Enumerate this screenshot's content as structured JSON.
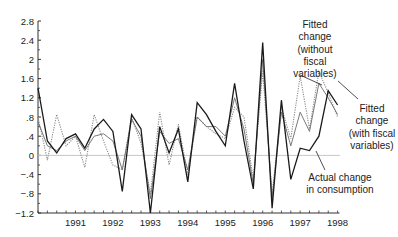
{
  "chart_data": {
    "type": "line",
    "title": "",
    "xlabel": "",
    "ylabel": "",
    "ylim": [
      -1.2,
      2.8
    ],
    "yticks": [
      2.8,
      2.4,
      2,
      1.6,
      1.2,
      0.8,
      0.4,
      0,
      -0.4,
      -0.8,
      -1.2
    ],
    "ytick_labels": [
      "2.8",
      "2.4",
      "2",
      "1.6",
      "1.2",
      ".8",
      ".4",
      "0",
      "-.4",
      "-.8",
      "-1.2"
    ],
    "xtick_labels": [
      "1991",
      "1992",
      "1993",
      "1994",
      "1995",
      "1996",
      "1997",
      "1998"
    ],
    "x_start": 1990.0,
    "x_step": 0.25,
    "grid": false,
    "zero_line": true,
    "series": [
      {
        "name": "Actual change in consumption",
        "style": "solid-dark",
        "values": [
          1.4,
          0.3,
          0.05,
          0.35,
          0.45,
          0.15,
          0.55,
          0.75,
          0.5,
          -0.75,
          0.85,
          0.55,
          -1.2,
          0.6,
          0.05,
          0.55,
          -0.55,
          1.1,
          0.85,
          0.5,
          0.2,
          1.5,
          0.3,
          -0.7,
          2.35,
          -1.1,
          1.15,
          -0.5,
          0.15,
          0.1,
          0.4,
          1.35,
          1.05
        ]
      },
      {
        "name": "Fitted change (with fiscal variables)",
        "style": "solid-gray",
        "values": [
          0.7,
          0.2,
          0.1,
          0.3,
          0.4,
          0.1,
          0.4,
          0.45,
          0.3,
          -0.3,
          0.75,
          0.4,
          -0.9,
          0.5,
          0.25,
          0.35,
          -0.3,
          0.8,
          0.6,
          0.6,
          0.4,
          1.2,
          0.55,
          -0.6,
          2.0,
          -0.9,
          0.9,
          0.2,
          0.9,
          0.5,
          1.5,
          1.2,
          0.85
        ]
      },
      {
        "name": "Fitted change (without fiscal variables)",
        "style": "dotted",
        "values": [
          0.8,
          -0.1,
          0.85,
          0.2,
          0.4,
          -0.25,
          0.85,
          0.3,
          -0.2,
          -0.3,
          0.8,
          0.25,
          -0.8,
          0.9,
          -0.2,
          0.65,
          -0.4,
          0.8,
          0.6,
          0.45,
          0.35,
          1.0,
          0.8,
          -0.5,
          1.75,
          -0.8,
          1.0,
          0.35,
          1.65,
          0.55,
          1.75,
          1.3,
          0.8
        ]
      }
    ],
    "annotations": [
      {
        "text": [
          "Fitted",
          "change",
          "(without",
          "fiscal",
          "variables)"
        ],
        "target": "Fitted change (without fiscal variables)"
      },
      {
        "text": [
          "Fitted",
          "change",
          "(with fiscal",
          "variables)"
        ],
        "target": "Fitted change (with fiscal variables)"
      },
      {
        "text": [
          "Actual change",
          "in consumption"
        ],
        "target": "Actual change in consumption"
      }
    ]
  },
  "colors": {
    "actual": "#1a1a1a",
    "fitted_with": "#6a6a6a",
    "fitted_without": "#8a8a8a",
    "zero_line": "#c8c8c8",
    "axis": "#333333"
  }
}
